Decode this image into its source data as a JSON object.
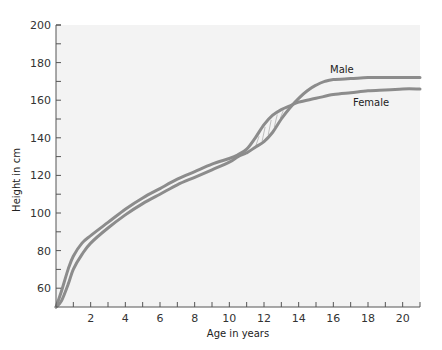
{
  "chart_data": {
    "type": "line",
    "title": "",
    "xlabel": "Age in years",
    "ylabel": "Height in cm",
    "xlim": [
      0,
      21
    ],
    "ylim": [
      50,
      200
    ],
    "x_ticks": [
      2,
      4,
      6,
      8,
      10,
      12,
      14,
      16,
      18,
      20
    ],
    "x_minor_step": 1,
    "y_ticks": [
      60,
      80,
      100,
      120,
      140,
      160,
      180,
      200
    ],
    "y_minor_step": 10,
    "grid": false,
    "legend": "inline labels",
    "series": [
      {
        "name": "Male",
        "x": [
          0,
          0.3,
          0.7,
          1,
          1.5,
          2,
          3,
          4,
          5,
          6,
          7,
          8,
          9,
          10,
          10.5,
          11,
          11.5,
          12,
          12.5,
          13,
          13.5,
          14,
          14.5,
          15,
          15.5,
          16,
          17,
          18,
          19,
          20,
          21
        ],
        "values": [
          50,
          53,
          62,
          70,
          78,
          84,
          92,
          99,
          105,
          110,
          115,
          119,
          123,
          127,
          130,
          132,
          135,
          138,
          143,
          150,
          156,
          161,
          165,
          168,
          170,
          171,
          171.5,
          172,
          172,
          172,
          172
        ]
      },
      {
        "name": "Female",
        "x": [
          0,
          0.3,
          0.7,
          1,
          1.5,
          2,
          3,
          4,
          5,
          6,
          7,
          8,
          9,
          10,
          10.5,
          11,
          11.5,
          12,
          12.5,
          13,
          13.5,
          14,
          15,
          16,
          17,
          18,
          19,
          20,
          21
        ],
        "values": [
          50,
          58,
          70,
          77,
          84,
          88,
          95,
          102,
          108,
          113,
          118,
          122,
          126,
          129,
          131,
          134,
          140,
          147,
          152,
          155,
          157,
          159,
          161,
          163,
          164,
          165,
          165.5,
          166,
          166
        ]
      }
    ],
    "annotations": [
      "Male",
      "Female",
      "shaded region between curves ~ages 11.3–13.5"
    ]
  }
}
